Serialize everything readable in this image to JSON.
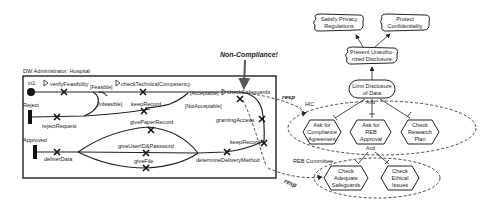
{
  "ucm": {
    "component_title": "DW Administrator: Hospital",
    "start_points": [
      {
        "label": "in1"
      },
      {
        "label": "Reject"
      },
      {
        "label": "Approved"
      }
    ],
    "responsibilities": {
      "verifyFeasibility": "verifyFeasibility",
      "checkTechnicalCompetency": "checkTechnicalCompetency",
      "keepRecord1": "keepRecord",
      "givePaperRecord": "givePaperRecord",
      "checkSafeguards": "checkSafeguards",
      "grantingAccess": "grantingAccess",
      "keepRecord2": "keepRecord",
      "rejectRequest": "rejectRequest",
      "deliverData": "deliverData",
      "giveUserIDPassword": "giveUserID&Password",
      "giveFile": "giveFile",
      "determineDeliveryMethod": "determineDeliveryMethod"
    },
    "conditions": {
      "feasible": "[Feasible]",
      "infeasible": "[Infeasible]",
      "acceptable": "[Acceptable]",
      "not_acceptable": "[NotAcceptable]"
    }
  },
  "annotation": {
    "non_compliance": "Non-Compliance!"
  },
  "links": {
    "resp1": "resp",
    "resp2": "resp"
  },
  "grl": {
    "softgoals": {
      "satisfy_privacy": [
        "Satisfy Privacy",
        "Regulations"
      ],
      "protect_confidentiality": [
        "Protect",
        "Confidentiality"
      ],
      "prevent_unauthorized": [
        "Prevent Unautho-",
        "rized Disclosure"
      ]
    },
    "goal": [
      "Limit Disclosure",
      "of Data"
    ],
    "and_labels": {
      "top": "And",
      "bottom": "And"
    },
    "actors": {
      "hic": "HIC",
      "reb_committee": "REB Committee"
    },
    "tasks": {
      "ask_compliance": [
        "Ask for",
        "Compliance",
        "Agreement"
      ],
      "ask_reb": [
        "Ask for",
        "REB",
        "Approval"
      ],
      "check_research": [
        "Check",
        "Research",
        "Plan"
      ],
      "check_safeguards": [
        "Check",
        "Adequate",
        "Safeguards"
      ],
      "check_ethical": [
        "Check",
        "Ethical",
        "Issues"
      ]
    }
  }
}
